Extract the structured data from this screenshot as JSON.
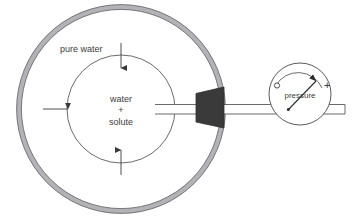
{
  "figure": {
    "background_color": "#ffffff"
  },
  "vessel": {
    "name": "outer vessel",
    "wall_color": "#b0b0b4",
    "wall_outline_color": "#6e6e72",
    "center_x": 121,
    "center_y": 109,
    "radius": 102,
    "wall_thickness": 5,
    "contents_label": "pure water"
  },
  "inner_cell": {
    "name": "semipermeable cell",
    "outline_color": "#5a5a5a",
    "center_x": 121,
    "center_y": 109,
    "radius": 54,
    "label_line1": "water",
    "label_line2": "+",
    "label_line3": "solute"
  },
  "arrows": {
    "color": "#3a3a3a",
    "items": [
      {
        "name": "arrow-top",
        "direction": "down",
        "label": ""
      },
      {
        "name": "arrow-bottom",
        "direction": "up",
        "label": ""
      },
      {
        "name": "arrow-left",
        "direction": "right",
        "label": ""
      }
    ]
  },
  "plug": {
    "name": "membrane plug",
    "fill_color": "#3a3a3a",
    "shape": "trapezoid"
  },
  "tube": {
    "name": "capillary tube",
    "outline_color": "#5a5a5a",
    "fill_color": "#ffffff"
  },
  "gauge": {
    "name": "pressure gauge",
    "label": "pressure",
    "zero_mark": "o",
    "plus_mark": "+",
    "outline_color": "#5a5a5a",
    "needle_color": "#2e2e2e",
    "center_x": 300,
    "center_y": 94,
    "radius": 31
  }
}
